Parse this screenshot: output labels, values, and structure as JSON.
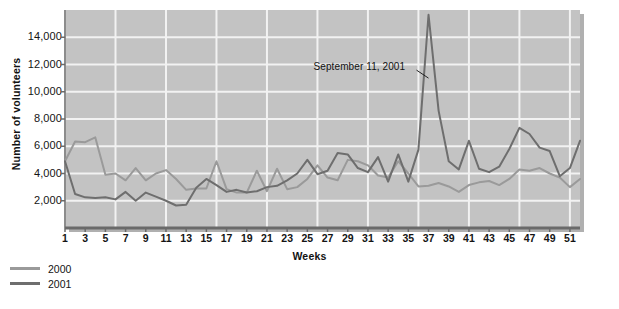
{
  "chart_data": {
    "type": "line",
    "title": "",
    "xlabel": "Weeks",
    "ylabel": "Number of volunteers",
    "xlim": [
      1,
      52
    ],
    "ylim": [
      0,
      16000
    ],
    "grid": true,
    "legend_position": "below-left",
    "ytick_labels": [
      "2,000",
      "4,000",
      "6,000",
      "8,000",
      "10,000",
      "12,000",
      "14,000"
    ],
    "ytick_values": [
      2000,
      4000,
      6000,
      8000,
      10000,
      12000,
      14000
    ],
    "xtick_labels": [
      "1",
      "3",
      "5",
      "7",
      "9",
      "11",
      "13",
      "15",
      "17",
      "19",
      "21",
      "23",
      "25",
      "27",
      "29",
      "31",
      "33",
      "35",
      "37",
      "39",
      "41",
      "43",
      "45",
      "47",
      "49",
      "51"
    ],
    "xtick_values": [
      1,
      3,
      5,
      7,
      9,
      11,
      13,
      15,
      17,
      19,
      21,
      23,
      25,
      27,
      29,
      31,
      33,
      35,
      37,
      39,
      41,
      43,
      45,
      47,
      49,
      51
    ],
    "x": [
      1,
      2,
      3,
      4,
      5,
      6,
      7,
      8,
      9,
      10,
      11,
      12,
      13,
      14,
      15,
      16,
      17,
      18,
      19,
      20,
      21,
      22,
      23,
      24,
      25,
      26,
      27,
      28,
      29,
      30,
      31,
      32,
      33,
      34,
      35,
      36,
      37,
      38,
      39,
      40,
      41,
      42,
      43,
      44,
      45,
      46,
      47,
      48,
      49,
      50,
      51,
      52
    ],
    "series": [
      {
        "name": "2000",
        "color": "#9a9a9a",
        "values": [
          4900,
          6350,
          6300,
          6650,
          3900,
          4000,
          3500,
          4400,
          3500,
          4000,
          4250,
          3600,
          2800,
          2900,
          2900,
          4900,
          2850,
          2600,
          2600,
          4200,
          2700,
          4350,
          2850,
          3000,
          3600,
          4600,
          3700,
          3500,
          5000,
          4900,
          4600,
          3850,
          3700,
          4900,
          4000,
          3050,
          3100,
          3300,
          3050,
          2650,
          3150,
          3350,
          3450,
          3150,
          3600,
          4300,
          4200,
          4400,
          4000,
          3700,
          3000,
          3600
        ]
      },
      {
        "name": "2001",
        "color": "#6e6e6e",
        "values": [
          4900,
          2500,
          2250,
          2200,
          2250,
          2100,
          2650,
          2000,
          2600,
          2300,
          2000,
          1650,
          1700,
          2950,
          3600,
          3150,
          2650,
          2800,
          2600,
          2700,
          3000,
          3100,
          3500,
          4000,
          5000,
          3950,
          4200,
          5500,
          5400,
          4400,
          4100,
          5200,
          3400,
          5400,
          3400,
          5750,
          15650,
          8600,
          4900,
          4300,
          6400,
          4350,
          4100,
          4500,
          5800,
          7350,
          6900,
          5900,
          5650,
          3800,
          4400,
          6400
        ]
      }
    ],
    "annotations": [
      {
        "text": "September 11, 2001",
        "target_week": 37,
        "target_value": 11000
      }
    ]
  },
  "legend": {
    "items": [
      {
        "label": "2000",
        "color": "#9a9a9a"
      },
      {
        "label": "2001",
        "color": "#6e6e6e"
      }
    ]
  },
  "colors": {
    "plot_background": "#c3c3c3",
    "gridline": "#f2f2f2",
    "axis": "#6a6a6a",
    "page_background": "#ffffff"
  }
}
